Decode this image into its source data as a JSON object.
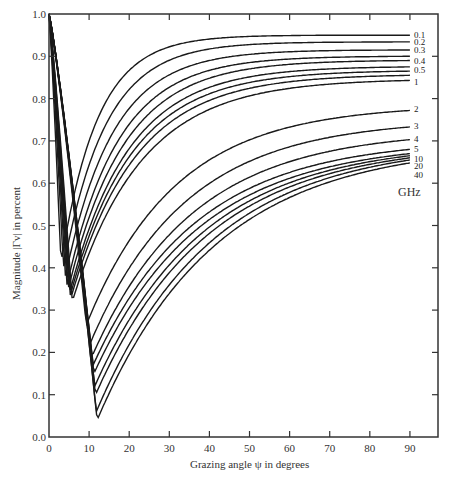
{
  "chart_data": {
    "type": "line",
    "title": "",
    "xlabel": "Grazing angle ψ in degrees",
    "ylabel": "Magnitude |Γv| in percent",
    "xlim": [
      0,
      97
    ],
    "ylim": [
      0,
      1.0
    ],
    "x_ticks": [
      "0",
      "10",
      "20",
      "30",
      "40",
      "50",
      "60",
      "70",
      "80",
      "90"
    ],
    "y_ticks": [
      "0.0",
      "0.1",
      "0.2",
      "0.3",
      "0.4",
      "0.5",
      "0.6",
      "0.7",
      "0.8",
      "0.9",
      "1.0"
    ],
    "grid": false,
    "legend_unit": "GHz",
    "series": [
      {
        "name": "0.1",
        "label": "0.1",
        "min_x": 3.0,
        "min_y": 0.41,
        "end_y": 0.95,
        "k": 0.11
      },
      {
        "name": "0.2",
        "label": "0.2",
        "min_x": 3.6,
        "min_y": 0.4,
        "end_y": 0.934,
        "k": 0.095
      },
      {
        "name": "0.3",
        "label": "0.3",
        "min_x": 4.1,
        "min_y": 0.38,
        "end_y": 0.915,
        "k": 0.085
      },
      {
        "name": "0.4",
        "label": "0.4",
        "min_x": 4.5,
        "min_y": 0.36,
        "end_y": 0.9,
        "k": 0.078
      },
      {
        "name": "0.5",
        "label": "0.5",
        "min_x": 4.8,
        "min_y": 0.35,
        "end_y": 0.89,
        "k": 0.072
      },
      {
        "name": "0.6",
        "label": "",
        "min_x": 5.1,
        "min_y": 0.34,
        "end_y": 0.875,
        "k": 0.068
      },
      {
        "name": "0.7",
        "label": "",
        "min_x": 5.3,
        "min_y": 0.335,
        "end_y": 0.865,
        "k": 0.065
      },
      {
        "name": "0.8",
        "label": "",
        "min_x": 5.5,
        "min_y": 0.33,
        "end_y": 0.855,
        "k": 0.062
      },
      {
        "name": "1",
        "label": "1",
        "min_x": 5.8,
        "min_y": 0.32,
        "end_y": 0.843,
        "k": 0.058
      },
      {
        "name": "2",
        "label": "2",
        "min_x": 9.3,
        "min_y": 0.265,
        "end_y": 0.772,
        "k": 0.045
      },
      {
        "name": "3",
        "label": "3",
        "min_x": 10.2,
        "min_y": 0.22,
        "end_y": 0.733,
        "k": 0.042
      },
      {
        "name": "4",
        "label": "4",
        "min_x": 10.7,
        "min_y": 0.19,
        "end_y": 0.703,
        "k": 0.04
      },
      {
        "name": "5",
        "label": "5",
        "min_x": 11.0,
        "min_y": 0.17,
        "end_y": 0.68,
        "k": 0.039
      },
      {
        "name": "6",
        "label": "",
        "min_x": 11.2,
        "min_y": 0.15,
        "end_y": 0.67,
        "k": 0.038
      },
      {
        "name": "8",
        "label": "",
        "min_x": 11.4,
        "min_y": 0.12,
        "end_y": 0.665,
        "k": 0.037
      },
      {
        "name": "10",
        "label": "10",
        "min_x": 11.6,
        "min_y": 0.1,
        "end_y": 0.66,
        "k": 0.036
      },
      {
        "name": "20",
        "label": "20",
        "min_x": 11.8,
        "min_y": 0.06,
        "end_y": 0.655,
        "k": 0.035
      },
      {
        "name": "40",
        "label": "40",
        "min_x": 12.0,
        "min_y": 0.04,
        "end_y": 0.648,
        "k": 0.034
      }
    ],
    "label_positions": [
      {
        "text": "0.1",
        "y": 0.95
      },
      {
        "text": "0.2",
        "y": 0.934
      },
      {
        "text": "0.3",
        "y": 0.915
      },
      {
        "text": "0.4",
        "y": 0.89
      },
      {
        "text": "0.5",
        "y": 0.868
      },
      {
        "text": "1",
        "y": 0.84
      },
      {
        "text": "2",
        "y": 0.775
      },
      {
        "text": "3",
        "y": 0.735
      },
      {
        "text": "4",
        "y": 0.705
      },
      {
        "text": "5",
        "y": 0.682
      },
      {
        "text": "10",
        "y": 0.658
      },
      {
        "text": "20",
        "y": 0.64
      },
      {
        "text": "40",
        "y": 0.62
      }
    ]
  },
  "labels": {
    "xlabel": "Grazing angle ψ in degrees",
    "ylabel": "Magnitude |Γv| in percent",
    "unit": "GHz"
  }
}
